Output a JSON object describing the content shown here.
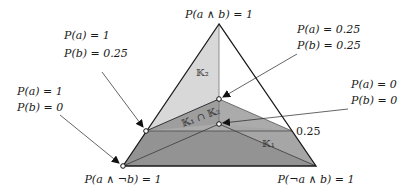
{
  "diagram": {
    "type": "probability-simplex",
    "vertices": {
      "top": {
        "label": "P(a ∧ b) = 1"
      },
      "bottom_left": {
        "label": "P(a ∧ ¬b) = 1"
      },
      "bottom_right": {
        "label": "P(¬a ∧ b) = 1"
      }
    },
    "regions": {
      "k2": "𝕂₂",
      "k1": "𝕂₁",
      "intersection": "𝕂₁ ∩ 𝕂₂"
    },
    "callouts": [
      {
        "id": "a1-b025",
        "line1": "P(a) = 1",
        "line2": "P(b) = 0.25"
      },
      {
        "id": "a1-b0",
        "line1": "P(a) = 1",
        "line2": "P(b) = 0"
      },
      {
        "id": "a025-b025",
        "line1": "P(a) = 0.25",
        "line2": "P(b) = 0.25"
      },
      {
        "id": "a0-b0",
        "line1": "P(a) = 0",
        "line2": "P(b) = 0"
      }
    ],
    "tick_label": "0.25",
    "colors": {
      "light_region": "#d6d6d6",
      "mid_region": "#a8a8a8",
      "dark_region": "#8e8e8e",
      "edge": "#1a1a1a"
    }
  }
}
